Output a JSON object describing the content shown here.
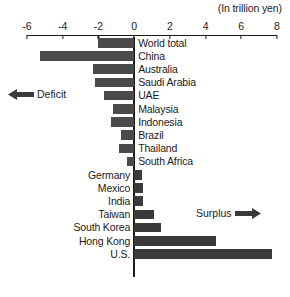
{
  "chart_data": {
    "type": "bar",
    "orientation": "horizontal",
    "title": "",
    "unit_note": "(In trillion yen)",
    "xlabel": "",
    "ylabel": "",
    "xlim": [
      -6,
      8
    ],
    "grid": false,
    "legend": "none",
    "tick_labels": [
      "-6",
      "-4",
      "-2",
      "0",
      "2",
      "4",
      "6",
      "8"
    ],
    "ticks": [
      -6,
      -4,
      -2,
      0,
      2,
      4,
      6,
      8
    ],
    "categories": [
      "World total",
      "China",
      "Australia",
      "Saudi Arabia",
      "UAE",
      "Malaysia",
      "Indonesia",
      "Brazil",
      "Thailand",
      "South Africa",
      "Germany",
      "Mexico",
      "India",
      "Taiwan",
      "South Korea",
      "Hong Kong",
      "U.S."
    ],
    "values": [
      -2.0,
      -5.3,
      -2.3,
      -2.2,
      -1.7,
      -1.2,
      -1.3,
      -0.75,
      -0.85,
      -0.4,
      0.45,
      0.5,
      0.5,
      1.1,
      1.5,
      4.6,
      7.7
    ],
    "annotations": [
      {
        "name": "deficit",
        "text": "Deficit",
        "direction": "left"
      },
      {
        "name": "surplus",
        "text": "Surplus",
        "direction": "right"
      }
    ],
    "colors": {
      "bar": "#3a3a3a",
      "axis": "#1b1b1b",
      "text": "#1b1b1b",
      "background": "#ffffff"
    }
  }
}
